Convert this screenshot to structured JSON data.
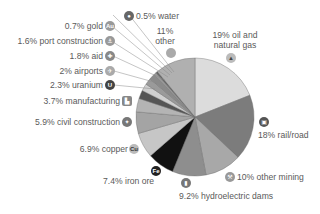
{
  "chart_data": {
    "type": "pie",
    "title": "",
    "start_angle_deg": 0,
    "direction": "clockwise",
    "slices": [
      {
        "label": "oil and natural gas",
        "value": 19,
        "display": "19% oil and natural gas",
        "color": "#dcdcdc",
        "icon": "oil-rig-icon"
      },
      {
        "label": "rail/road",
        "value": 18,
        "display": "18% rail/road",
        "color": "#7c7c7c",
        "icon": "train-icon"
      },
      {
        "label": "other mining",
        "value": 10,
        "display": "10% other mining",
        "color": "#a8a8a8",
        "icon": "pickaxe-icon"
      },
      {
        "label": "hydroelectric dams",
        "value": 9.2,
        "display": "9.2% hydroelectric dams",
        "color": "#8e8e8e",
        "icon": "dam-icon"
      },
      {
        "label": "iron ore",
        "value": 7.4,
        "display": "7.4% iron ore",
        "color": "#111111",
        "icon": "fe-icon"
      },
      {
        "label": "copper",
        "value": 6.9,
        "display": "6.9% copper",
        "color": "#c6c6c6",
        "icon": "cu-icon"
      },
      {
        "label": "civil construction",
        "value": 5.9,
        "display": "5.9% civil construction",
        "color": "#a4a4a4",
        "icon": "trowel-icon"
      },
      {
        "label": "manufacturing",
        "value": 3.7,
        "display": "3.7% manufacturing",
        "color": "#b4b4b4",
        "icon": "factory-icon"
      },
      {
        "label": "uranium",
        "value": 2.3,
        "display": "2.3% uranium",
        "color": "#555555",
        "icon": "uranium-icon"
      },
      {
        "label": "airports",
        "value": 2,
        "display": "2% airports",
        "color": "#cfcfcf",
        "icon": "airplane-icon"
      },
      {
        "label": "aid",
        "value": 1.8,
        "display": "1.8% aid",
        "color": "#9a9a9a",
        "icon": "cross-icon"
      },
      {
        "label": "port construction",
        "value": 1.6,
        "display": "1.6% port construction",
        "color": "#8a8a8a",
        "icon": "anchor-icon"
      },
      {
        "label": "gold",
        "value": 0.7,
        "display": "0.7% gold",
        "color": "#989898",
        "icon": "au-icon"
      },
      {
        "label": "water",
        "value": 0.5,
        "display": "0.5% water",
        "color": "#666666",
        "icon": "water-drop-icon"
      },
      {
        "label": "other",
        "value": 11,
        "display": "11% other",
        "color": "#b0b0b0",
        "icon": "circle-icon"
      }
    ],
    "legend": "none (inline labels)"
  },
  "labels": {
    "water": "0.5% water",
    "gold": "0.7% gold",
    "port": "1.6% port construction",
    "aid": "1.8% aid",
    "airports": "2% airports",
    "uranium": "2.3% uranium",
    "manufacturing": "3.7% manufacturing",
    "civil": "5.9% civil construction",
    "copper": "6.9% copper",
    "iron": "7.4% iron ore",
    "hydro": "9.2% hydroelectric dams",
    "mining": "10% other mining",
    "rail": "18% rail/road",
    "oil_line1": "19% oil and",
    "oil_line2": "natural gas",
    "other_line1": "11%",
    "other_line2": "other"
  },
  "icons": {
    "gold": "Au",
    "uranium": "U",
    "iron": "Fe",
    "copper": "Cu"
  }
}
